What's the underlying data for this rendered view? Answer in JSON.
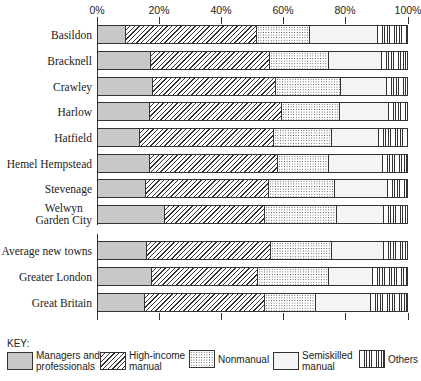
{
  "chart_data": {
    "type": "bar",
    "orientation": "horizontal",
    "stacked": true,
    "percent": true,
    "title": "",
    "xlabel": "",
    "ylabel": "",
    "xlim": [
      0,
      100
    ],
    "x_ticks": [
      "0%",
      "20%",
      "40%",
      "60%",
      "80%",
      "100%"
    ],
    "grid": false,
    "legend_position": "bottom",
    "legend_title": "KEY:",
    "categories": [
      "Basildon",
      "Bracknell",
      "Crawley",
      "Harlow",
      "Hatfield",
      "Hemel Hempstead",
      "Stevenage",
      "Welwyn Garden City",
      "Average new towns",
      "Greater London",
      "Great Britain"
    ],
    "series": [
      {
        "name": "Managers and professionals",
        "pattern": "fine-dots-gray",
        "values": [
          8.9,
          17.1,
          17.7,
          16.9,
          13.7,
          16.7,
          15.5,
          21.8,
          15.8,
          17.5,
          15.2
        ]
      },
      {
        "name": "High-income manual",
        "pattern": "diagonal-hatch",
        "values": [
          42.5,
          38.5,
          39.9,
          42.7,
          43.1,
          41.7,
          39.7,
          32.1,
          40.3,
          34.3,
          38.7
        ]
      },
      {
        "name": "Nonmanual",
        "pattern": "grid-dots",
        "values": [
          17.1,
          19.1,
          21.2,
          18.6,
          18.9,
          16.4,
          21.5,
          23.3,
          19.5,
          22.9,
          16.8
        ]
      },
      {
        "name": "Semiskilled manual",
        "pattern": "dashes",
        "values": [
          22.2,
          17.2,
          14.8,
          16.0,
          15.1,
          17.6,
          17.3,
          15.5,
          17.1,
          14.2,
          17.8
        ]
      },
      {
        "name": "Others",
        "pattern": "vertical-lines",
        "values": [
          9.3,
          8.1,
          6.4,
          5.8,
          9.2,
          7.6,
          6.0,
          7.3,
          7.3,
          11.1,
          11.5
        ]
      }
    ]
  },
  "axis": {
    "ticks": [
      {
        "label": "0%",
        "x": 97
      },
      {
        "label": "20%",
        "x": 159
      },
      {
        "label": "40%",
        "x": 221
      },
      {
        "label": "60%",
        "x": 283
      },
      {
        "label": "80%",
        "x": 345
      },
      {
        "label": "100%",
        "x": 408
      }
    ]
  },
  "rows": [
    {
      "label": "Basildon",
      "top": 25
    },
    {
      "label": "Bracknell",
      "top": 51
    },
    {
      "label": "Crawley",
      "top": 77
    },
    {
      "label": "Harlow",
      "top": 102
    },
    {
      "label": "Hatfield",
      "top": 128
    },
    {
      "label": "Hemel Hempstead",
      "top": 154
    },
    {
      "label": "Stevenage",
      "top": 179
    },
    {
      "label": "Welwyn\nGarden City",
      "top": 205
    },
    {
      "label": "Average new towns",
      "top": 241
    },
    {
      "label": "Greater London",
      "top": 267
    },
    {
      "label": "Great Britain",
      "top": 293
    }
  ],
  "key": {
    "title": "KEY:",
    "items": [
      {
        "label": "Managers and\nprofessionals",
        "cls": "p-mgr",
        "left": 7
      },
      {
        "label": "High-income\nmanual",
        "cls": "p-hi",
        "left": 100
      },
      {
        "label": "Nonmanual",
        "cls": "p-non",
        "left": 189
      },
      {
        "label": "Semiskilled\nmanual",
        "cls": "p-semi",
        "left": 273
      },
      {
        "label": "Others",
        "cls": "p-oth",
        "left": 359
      }
    ]
  }
}
